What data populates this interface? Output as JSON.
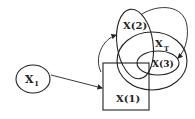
{
  "diagram": {
    "nodes": {
      "x_i": {
        "main": "X",
        "sub": "I"
      },
      "x_1": {
        "label": "X(1)"
      },
      "x_2": {
        "label": "X(2)"
      },
      "x_t": {
        "main": "X",
        "sub": "T"
      },
      "x_3": {
        "label": "X(3)"
      }
    },
    "colors": {
      "stroke": "#222222",
      "background": "#ffffff"
    }
  }
}
